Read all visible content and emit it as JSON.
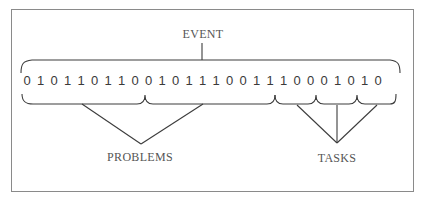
{
  "figure": {
    "labels": {
      "event": "EVENT",
      "problems": "PROBLEMS",
      "tasks": "TASKS"
    },
    "bit_sequence": [
      "0",
      "1",
      "0",
      "1",
      "1",
      "0",
      "1",
      "1",
      "0",
      "0",
      "1",
      "0",
      "1",
      "1",
      "1",
      "0",
      "0",
      "1",
      "1",
      "1",
      "0",
      "0",
      "0",
      "1",
      "0",
      "1",
      "0"
    ],
    "groups": {
      "event": {
        "label": "EVENT",
        "covers": "all 27 bits"
      },
      "problems": [
        {
          "bits": "0101101100"
        },
        {
          "bits": "1011100111"
        }
      ],
      "tasks": [
        {
          "bits": "000"
        },
        {
          "bits": "101"
        },
        {
          "bits": "0"
        }
      ]
    },
    "colors": {
      "frame": "#8a8a8a",
      "lines": "#3c3c3c",
      "text": "#555555"
    }
  }
}
